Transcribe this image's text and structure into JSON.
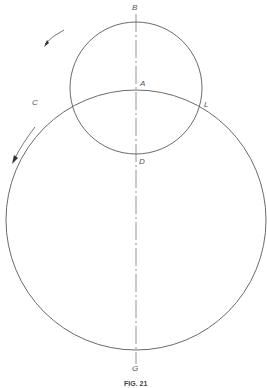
{
  "figure": {
    "caption": "FIG. 21",
    "labels": {
      "B": "B",
      "A": "A",
      "C": "C",
      "L": "L",
      "D": "D",
      "G": "G"
    },
    "small_circle": {
      "cx": 136,
      "cy": 88,
      "r": 66
    },
    "large_circle": {
      "cx": 136,
      "cy": 220,
      "r": 130
    },
    "axis_x": 136,
    "stroke_color": "#6a6a6a"
  }
}
